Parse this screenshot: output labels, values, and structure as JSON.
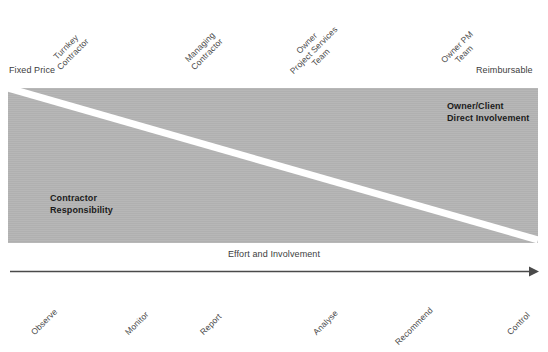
{
  "diagram": {
    "title": "Effort and Involvement",
    "colors": {
      "band_fill": "#b4b4b4",
      "divider": "#ffffff",
      "text": "#3d3d3d",
      "emphasis_text": "#1b1b1b",
      "arrow": "#4a4a4a",
      "background": "#ffffff"
    },
    "top_axis": {
      "left_endpoint": "Fixed Price",
      "right_endpoint": "Reimbursable",
      "labels": [
        {
          "lines": [
            "Turnkey",
            "Contractor"
          ]
        },
        {
          "lines": [
            "Managing",
            "Contractor"
          ]
        },
        {
          "lines": [
            "Owner",
            "Project Services",
            "Team"
          ]
        },
        {
          "lines": [
            "Owner PM",
            "Team"
          ]
        }
      ]
    },
    "band": {
      "lower_left_label": [
        "Contractor",
        "Responsibility"
      ],
      "upper_right_label": [
        "Owner/Client",
        "Direct Involvement"
      ]
    },
    "axis_arrow": {
      "caption": "Effort and Involvement"
    },
    "bottom_axis": {
      "labels": [
        "Observe",
        "Monitor",
        "Report",
        "Analyse",
        "Recommend",
        "Control"
      ]
    }
  }
}
